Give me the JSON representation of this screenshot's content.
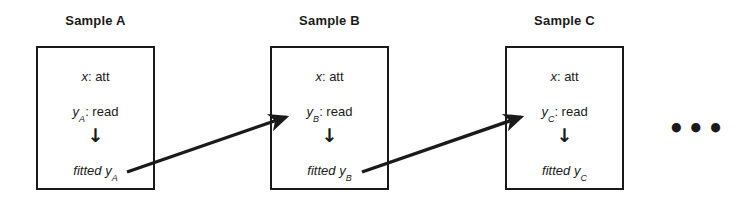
{
  "diagram": {
    "type": "sequential-sample-flow",
    "background_color": "#ffffff",
    "stroke_color": "#1a1a1a",
    "ellipsis": "•••",
    "down_arrow_glyph": "↓",
    "samples": [
      {
        "title": "Sample A",
        "attribute_line": "x: att",
        "attribute_var": "x",
        "attribute_value": ": att",
        "read_var": "y",
        "read_subscript": "A",
        "read_value": ": read",
        "fitted_label": "fitted y",
        "fitted_subscript": "A",
        "box": {
          "x": 36,
          "y": 46,
          "width": 119,
          "height": 144
        },
        "title_pos": {
          "x": 36,
          "y": 13,
          "width": 119
        }
      },
      {
        "title": "Sample B",
        "attribute_line": "x: att",
        "attribute_var": "x",
        "attribute_value": ": att",
        "read_var": "y",
        "read_subscript": "B",
        "read_value": ": read",
        "fitted_label": "fitted y",
        "fitted_subscript": "B",
        "box": {
          "x": 270,
          "y": 46,
          "width": 119,
          "height": 144
        },
        "title_pos": {
          "x": 270,
          "y": 13,
          "width": 119
        }
      },
      {
        "title": "Sample C",
        "attribute_line": "x: att",
        "attribute_var": "x",
        "attribute_value": ": att",
        "read_var": "y",
        "read_subscript": "C",
        "read_value": ": read",
        "fitted_label": "fitted y",
        "fitted_subscript": "C",
        "box": {
          "x": 505,
          "y": 46,
          "width": 119,
          "height": 144
        },
        "title_pos": {
          "x": 505,
          "y": 13,
          "width": 119
        }
      }
    ],
    "connectors": [
      {
        "name": "arrow-a-to-b",
        "x1": 127,
        "y1": 172,
        "x2": 287,
        "y2": 117
      },
      {
        "name": "arrow-b-to-c",
        "x1": 362,
        "y1": 172,
        "x2": 522,
        "y2": 117
      }
    ],
    "ellipsis_pos": {
      "x": 668,
      "y": 116
    }
  }
}
